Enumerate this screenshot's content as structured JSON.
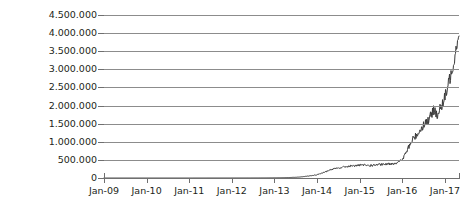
{
  "chart_data": {
    "type": "line",
    "title": "",
    "subtitle": "",
    "xlabel": "",
    "ylabel": "Taxa de Hash (TH/s)",
    "grid": true,
    "legend": null,
    "legend_position": "none",
    "line_color": "#3a3a3a",
    "grid_color": "#8c8c8c",
    "axis_color": "#6f6f6f",
    "text_color": "#231f20",
    "ylim": [
      0,
      4500000
    ],
    "ytick_labels": [
      "4.500.000",
      "4.000.000",
      "3.500.000",
      "3.000.000",
      "2.500.000",
      "2.000.000",
      "1.500.000",
      "1.000.000",
      "500.000",
      "0"
    ],
    "ytick_values": [
      4500000,
      4000000,
      3500000,
      3000000,
      2500000,
      2000000,
      1500000,
      1000000,
      500000,
      0
    ],
    "xtick_labels": [
      "Jan-09",
      "Jan-10",
      "Jan-11",
      "Jan-12",
      "Jan-13",
      "Jan-14",
      "Jan-15",
      "Jan-16",
      "Jan-17"
    ],
    "xlim": [
      2009.0,
      2017.33
    ],
    "series": [
      {
        "name": "Taxa de Hash",
        "units": "TH/s",
        "x": [
          2009.0,
          2009.25,
          2009.5,
          2009.75,
          2010.0,
          2010.25,
          2010.5,
          2010.75,
          2011.0,
          2011.25,
          2011.5,
          2011.75,
          2012.0,
          2012.25,
          2012.5,
          2012.75,
          2013.0,
          2013.17,
          2013.33,
          2013.5,
          2013.67,
          2013.83,
          2014.0,
          2014.08,
          2014.17,
          2014.25,
          2014.33,
          2014.42,
          2014.5,
          2014.58,
          2014.67,
          2014.75,
          2014.83,
          2014.92,
          2015.0,
          2015.08,
          2015.17,
          2015.25,
          2015.33,
          2015.42,
          2015.5,
          2015.58,
          2015.67,
          2015.75,
          2015.83,
          2015.92,
          2016.0,
          2016.08,
          2016.17,
          2016.25,
          2016.33,
          2016.42,
          2016.5,
          2016.58,
          2016.67,
          2016.75,
          2016.83,
          2016.92,
          2017.0,
          2017.08,
          2017.17,
          2017.25,
          2017.33
        ],
        "values": [
          0,
          0,
          0,
          0,
          0,
          0,
          0,
          0,
          100,
          200,
          500,
          700,
          1000,
          1500,
          2000,
          3000,
          5000,
          8000,
          12000,
          20000,
          35000,
          60000,
          90000,
          120000,
          160000,
          200000,
          230000,
          255000,
          275000,
          295000,
          310000,
          325000,
          335000,
          345000,
          350000,
          355000,
          350000,
          345000,
          355000,
          365000,
          370000,
          375000,
          385000,
          395000,
          410000,
          440000,
          510000,
          680000,
          900000,
          1080000,
          1180000,
          1320000,
          1480000,
          1560000,
          1700000,
          1900000,
          1750000,
          1980000,
          2200000,
          2600000,
          3000000,
          3500000,
          4050000
        ],
        "noise_band": 180000,
        "max_value": 4100000,
        "min_value": 0
      }
    ],
    "annotations": []
  }
}
